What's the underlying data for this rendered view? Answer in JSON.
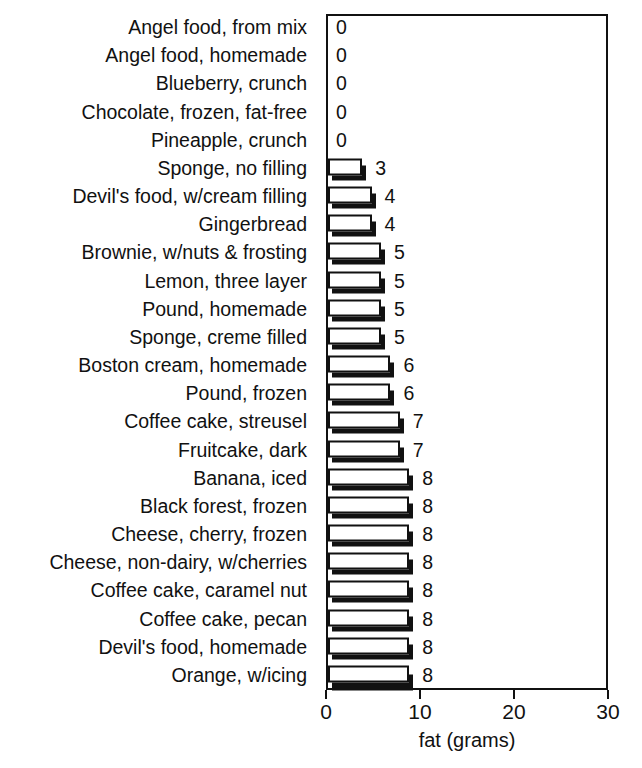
{
  "top_clipped_text": "",
  "axis": {
    "x_label": "fat (grams)",
    "ticks": [
      "0",
      "10",
      "20",
      "30"
    ]
  },
  "chart_data": {
    "type": "bar",
    "orientation": "horizontal",
    "title": "",
    "xlabel": "fat (grams)",
    "ylabel": "",
    "xlim": [
      0,
      30
    ],
    "xticks": [
      0,
      10,
      20,
      30
    ],
    "grid": false,
    "legend": null,
    "bar_style": {
      "face": "#ffffff",
      "outline": "#111111",
      "shadow": "#111111"
    },
    "data_labels": true,
    "categories": [
      "Angel food, from mix",
      "Angel food, homemade",
      "Blueberry, crunch",
      "Chocolate, frozen, fat-free",
      "Pineapple, crunch",
      "Sponge, no filling",
      "Devil's food, w/cream filling",
      "Gingerbread",
      "Brownie, w/nuts & frosting",
      "Lemon, three layer",
      "Pound, homemade",
      "Sponge, creme filled",
      "Boston cream, homemade",
      "Pound, frozen",
      "Coffee cake, streusel",
      "Fruitcake, dark",
      "Banana, iced",
      "Black forest, frozen",
      "Cheese, cherry, frozen",
      "Cheese, non-dairy, w/cherries",
      "Coffee cake, caramel nut",
      "Coffee cake, pecan",
      "Devil's food, homemade",
      "Orange, w/icing"
    ],
    "values": [
      0,
      0,
      0,
      0,
      0,
      3,
      4,
      4,
      5,
      5,
      5,
      5,
      6,
      6,
      7,
      7,
      8,
      8,
      8,
      8,
      8,
      8,
      8,
      8
    ],
    "value_labels": [
      "0",
      "0",
      "0",
      "0",
      "0",
      "3",
      "4",
      "4",
      "5",
      "5",
      "5",
      "5",
      "6",
      "6",
      "7",
      "7",
      "8",
      "8",
      "8",
      "8",
      "8",
      "8",
      "8",
      "8"
    ]
  }
}
